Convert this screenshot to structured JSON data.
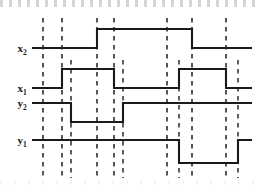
{
  "figure": {
    "kind": "digital-timing-diagram",
    "width": 256,
    "height": 185,
    "background_color": "#ffffff",
    "stroke_color": "#1a1a1a",
    "dash_color": "#2b2b2b"
  },
  "time_markers": [
    {
      "id": "t0",
      "base": "t",
      "sub": "0",
      "x": 43,
      "label_x": 43,
      "label_y": 12
    },
    {
      "id": "t1",
      "base": "t",
      "sub": "1",
      "x": 62,
      "label_x": 62,
      "label_y": 12
    },
    {
      "id": "t2",
      "base": "t",
      "sub": "2",
      "x": 97,
      "label_x": 97,
      "label_y": 12
    },
    {
      "id": "t3",
      "base": "t",
      "sub": "3",
      "x": 114,
      "label_x": 114,
      "label_y": 12
    },
    {
      "id": "t4",
      "base": "t",
      "sub": "4",
      "x": 167,
      "label_x": 167,
      "label_y": 12
    },
    {
      "id": "t5",
      "base": "t",
      "sub": "5",
      "x": 192,
      "label_x": 192,
      "label_y": 12
    },
    {
      "id": "t6",
      "base": "t",
      "sub": "6",
      "x": 226,
      "label_x": 226,
      "label_y": 12
    }
  ],
  "aux_markers": [
    {
      "id": "aux-y2-fall",
      "x": 71,
      "top": 60,
      "bottom": 178
    },
    {
      "id": "aux-y2-rise",
      "x": 123,
      "top": 60,
      "bottom": 178
    },
    {
      "id": "aux-x1-rise",
      "x": 179,
      "top": 60,
      "bottom": 178
    },
    {
      "id": "aux-y1-rise",
      "x": 238,
      "top": 60,
      "bottom": 178
    }
  ],
  "signals": [
    {
      "id": "x2",
      "base": "x",
      "sub": "2",
      "label_x": 22,
      "label_y": 52,
      "low_y": 48,
      "high_y": 29,
      "start_x": 32,
      "end_x": 252,
      "initial_level": "low",
      "transitions": [
        {
          "x": 97,
          "to": "high",
          "at": "t2"
        },
        {
          "x": 192,
          "to": "low",
          "at": "t5"
        }
      ]
    },
    {
      "id": "x1",
      "base": "x",
      "sub": "1",
      "label_x": 22,
      "label_y": 92,
      "low_y": 88,
      "high_y": 69,
      "start_x": 32,
      "end_x": 252,
      "initial_level": "low",
      "transitions": [
        {
          "x": 62,
          "to": "high",
          "at": "t1"
        },
        {
          "x": 114,
          "to": "low",
          "at": "t3"
        },
        {
          "x": 179,
          "to": "high",
          "at": "after-t4"
        },
        {
          "x": 226,
          "to": "low",
          "at": "t6"
        }
      ]
    },
    {
      "id": "y2",
      "base": "y",
      "sub": "2",
      "label_x": 22,
      "label_y": 107,
      "low_y": 122,
      "high_y": 103,
      "start_x": 32,
      "end_x": 252,
      "initial_level": "high",
      "transitions": [
        {
          "x": 71,
          "to": "low",
          "at": "after-t1"
        },
        {
          "x": 123,
          "to": "high",
          "at": "after-t3"
        }
      ]
    },
    {
      "id": "y1",
      "base": "y",
      "sub": "1",
      "label_x": 22,
      "label_y": 144,
      "low_y": 163,
      "high_y": 140,
      "start_x": 32,
      "end_x": 252,
      "initial_level": "high",
      "transitions": [
        {
          "x": 179,
          "to": "low",
          "at": "after-t4"
        },
        {
          "x": 238,
          "to": "high",
          "at": "after-t6"
        }
      ]
    }
  ],
  "chart_data": {
    "type": "line",
    "title": "",
    "xlabel": "",
    "ylabel": "",
    "x": [
      "t0",
      "t1",
      "t2",
      "t3",
      "t4",
      "t5",
      "t6"
    ],
    "series": [
      {
        "name": "x2",
        "values": [
          0,
          0,
          1,
          1,
          1,
          0,
          0
        ]
      },
      {
        "name": "x1",
        "values": [
          0,
          1,
          1,
          0,
          0,
          1,
          0
        ]
      },
      {
        "name": "y2",
        "values": [
          1,
          0,
          0,
          1,
          1,
          1,
          1
        ]
      },
      {
        "name": "y1",
        "values": [
          1,
          1,
          1,
          1,
          0,
          0,
          1
        ]
      }
    ],
    "ylim": [
      0,
      1
    ],
    "grid": false,
    "legend": "none"
  }
}
